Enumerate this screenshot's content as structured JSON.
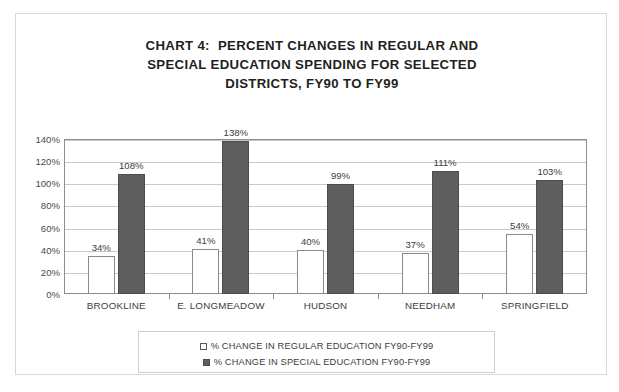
{
  "chart_data": {
    "type": "bar",
    "title": "CHART 4:  PERCENT CHANGES IN REGULAR AND SPECIAL EDUCATION SPENDING FOR SELECTED DISTRICTS, FY90 TO FY99",
    "title_lines": [
      "CHART 4:  PERCENT CHANGES IN REGULAR AND",
      "SPECIAL EDUCATION SPENDING FOR SELECTED",
      "DISTRICTS, FY90 TO FY99"
    ],
    "categories": [
      "BROOKLINE",
      "E. LONGMEADOW",
      "HUDSON",
      "NEEDHAM",
      "SPRINGFIELD"
    ],
    "series": [
      {
        "name": "% CHANGE IN REGULAR EDUCATION FY90-FY99",
        "key": "regular",
        "color": "#ffffff",
        "border_color": "#8a8a8a",
        "values": [
          34,
          41,
          40,
          37,
          54
        ],
        "labels": [
          "34%",
          "41%",
          "40%",
          "37%",
          "54%"
        ]
      },
      {
        "name": "% CHANGE IN SPECIAL EDUCATION FY90-FY99",
        "key": "special",
        "color": "#5e5e5e",
        "border_color": "#4d4d4d",
        "values": [
          108,
          138,
          99,
          111,
          103
        ],
        "labels": [
          "108%",
          "138%",
          "99%",
          "111%",
          "103%"
        ]
      }
    ],
    "xlabel": "",
    "ylabel": "",
    "ylim": [
      0,
      140
    ],
    "ytick_values": [
      0,
      20,
      40,
      60,
      80,
      100,
      120,
      140
    ],
    "ytick_labels": [
      "0%",
      "20%",
      "40%",
      "60%",
      "80%",
      "100%",
      "120%",
      "140%"
    ],
    "grid": true,
    "legend_position": "bottom",
    "value_labels": true
  },
  "legend": {
    "entries": [
      {
        "swatch": "regular",
        "label": "% CHANGE IN REGULAR EDUCATION FY90-FY99"
      },
      {
        "swatch": "special",
        "label": "% CHANGE IN SPECIAL EDUCATION FY90-FY99"
      }
    ]
  },
  "colors": {
    "regular_bar": "#ffffff",
    "special_bar": "#5e5e5e",
    "gridline": "#c9c9c9",
    "axis": "#8e8e8e",
    "frame_border": "#d8d8d8",
    "text": "#3c3c3c",
    "title_text": "#231f20"
  }
}
